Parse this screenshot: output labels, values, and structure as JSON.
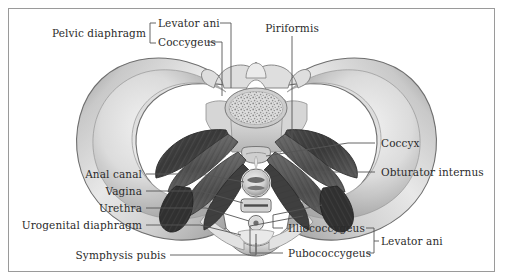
{
  "figure": {
    "border_color": "#9a9a9a",
    "background_color": "#ffffff",
    "text_color": "#2b2b2b",
    "leader_color": "#555555"
  },
  "labels": {
    "pelvic_diaphragm": "Pelvic diaphragm",
    "levator_ani_top": "Levator ani",
    "coccygeus": "Coccygeus",
    "piriformis": "Piriformis",
    "coccyx": "Coccyx",
    "obturator_internus": "Obturator internus",
    "anal_canal": "Anal canal",
    "vagina": "Vagina",
    "urethra": "Urethra",
    "urogenital_diaphragm": "Urogenital diaphragm",
    "symphysis_pubis": "Symphysis pubis",
    "illiococcygeus": "Illiococcygeus",
    "pubococcygeus": "Pubococcygeus",
    "levator_ani_bottom": "Levator ani"
  },
  "anatomy_parts": [
    {
      "name": "ilium-left",
      "type": "bone"
    },
    {
      "name": "ilium-right",
      "type": "bone"
    },
    {
      "name": "sacrum",
      "type": "bone"
    },
    {
      "name": "vertebral-body",
      "type": "bone"
    },
    {
      "name": "coccyx",
      "type": "bone"
    },
    {
      "name": "pubic-symphysis",
      "type": "bone"
    },
    {
      "name": "piriformis-left",
      "type": "muscle"
    },
    {
      "name": "piriformis-right",
      "type": "muscle"
    },
    {
      "name": "coccygeus-left",
      "type": "muscle"
    },
    {
      "name": "coccygeus-right",
      "type": "muscle"
    },
    {
      "name": "illiococcygeus-left",
      "type": "muscle"
    },
    {
      "name": "illiococcygeus-right",
      "type": "muscle"
    },
    {
      "name": "pubococcygeus-left",
      "type": "muscle"
    },
    {
      "name": "pubococcygeus-right",
      "type": "muscle"
    },
    {
      "name": "obturator-internus-left",
      "type": "muscle"
    },
    {
      "name": "obturator-internus-right",
      "type": "muscle"
    },
    {
      "name": "anal-canal",
      "type": "orifice"
    },
    {
      "name": "vagina",
      "type": "orifice"
    },
    {
      "name": "urethra",
      "type": "orifice"
    },
    {
      "name": "urogenital-diaphragm",
      "type": "membrane"
    }
  ]
}
